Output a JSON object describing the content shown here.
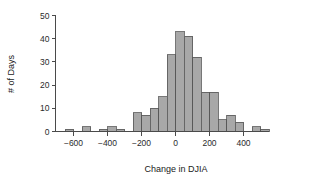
{
  "chart_data": {
    "type": "bar",
    "title": "",
    "subtitle": "",
    "xlabel": "Change in DJIA",
    "ylabel": "# of Days",
    "grid": false,
    "legend": false,
    "legend_position": "none",
    "bin_width": 50,
    "xlim": [
      -675,
      525
    ],
    "ylim": [
      0,
      50
    ],
    "xticks": [
      -600,
      -400,
      -200,
      0,
      200,
      400
    ],
    "xtick_labels": [
      "−600",
      "−400",
      "−200",
      "0",
      "200",
      "400"
    ],
    "yticks": [
      0,
      10,
      20,
      30,
      40,
      50
    ],
    "ytick_labels": [
      "0",
      "10",
      "20",
      "30",
      "40",
      "50"
    ],
    "bin_starts": [
      -650,
      -600,
      -550,
      -500,
      -450,
      -400,
      -350,
      -300,
      -250,
      -200,
      -150,
      -100,
      -50,
      0,
      50,
      100,
      150,
      200,
      250,
      300,
      350,
      400,
      450,
      500
    ],
    "categories": [
      "-650",
      "-600",
      "-550",
      "-500",
      "-450",
      "-400",
      "-350",
      "-300",
      "-250",
      "-200",
      "-150",
      "-100",
      "-50",
      "0",
      "50",
      "100",
      "150",
      "200",
      "250",
      "300",
      "350",
      "400",
      "450",
      "500"
    ],
    "values": [
      1,
      0,
      2,
      0,
      1,
      2,
      1,
      0,
      8,
      7,
      10,
      15,
      33,
      43,
      41,
      32,
      17,
      17,
      5,
      7,
      4,
      0,
      2,
      1
    ],
    "bar_color": "#a8a8a8",
    "bar_edge_color": "#555555",
    "axis_color": "#4a4a4a",
    "text_color": "#1a1a1a"
  }
}
